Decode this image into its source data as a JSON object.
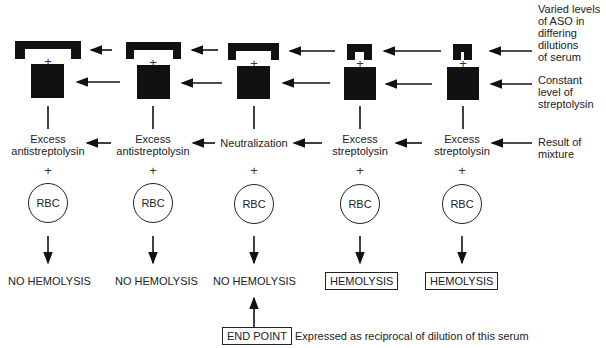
{
  "diagram": {
    "columns": [
      {
        "id": 1,
        "aso_level": "high",
        "result_of_mixture": [
          "Excess",
          "antistreptolysin"
        ],
        "rbc_label": "RBC",
        "outcome": "NO HEMOLYSIS",
        "outcome_boxed": false
      },
      {
        "id": 2,
        "aso_level": "high",
        "result_of_mixture": [
          "Excess",
          "antistreptolysin"
        ],
        "rbc_label": "RBC",
        "outcome": "NO HEMOLYSIS",
        "outcome_boxed": false
      },
      {
        "id": 3,
        "aso_level": "equal",
        "result_of_mixture": [
          "Neutralization",
          ""
        ],
        "rbc_label": "RBC",
        "outcome": "NO HEMOLYSIS",
        "outcome_boxed": false
      },
      {
        "id": 4,
        "aso_level": "low",
        "result_of_mixture": [
          "Excess",
          "streptolysin"
        ],
        "rbc_label": "RBC",
        "outcome": "HEMOLYSIS",
        "outcome_boxed": true
      },
      {
        "id": 5,
        "aso_level": "very low",
        "result_of_mixture": [
          "Excess",
          "streptolysin"
        ],
        "rbc_label": "RBC",
        "outcome": "HEMOLYSIS",
        "outcome_boxed": true
      }
    ],
    "plus_symbol": "+",
    "side_labels": {
      "aso": "Varied levels\nof ASO in\ndiffering\ndilutions\nof serum",
      "streptolysin": "Constant\nlevel of\nstreptolysin",
      "result": "Result of\nmixture"
    },
    "end_point": {
      "label": "END POINT",
      "description": "Expressed as reciprocal of dilution of this serum"
    },
    "colors": {
      "ink": "#111111",
      "background": "#ffffff"
    }
  }
}
